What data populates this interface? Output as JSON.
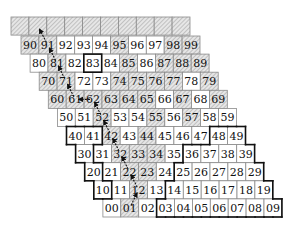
{
  "diagram": {
    "title": "",
    "geometry": {
      "top_row": {
        "x0": 11,
        "y0": 17
      },
      "row9_origin": {
        "x0": 21,
        "y0": 36
      },
      "cell_w": 17.9,
      "cell_h": 18.1,
      "row_shift_x": 9.1
    },
    "colors": {
      "hatch_bg": "#e6e6e6",
      "hatch_line": "#9a9a9a",
      "cell_border": "#8a8a8a",
      "bold_border": "#111111",
      "text": "#111111",
      "arrow": "#111111"
    },
    "top_row": {
      "count": 10,
      "hatched": true
    },
    "rows": [
      {
        "row": 9,
        "labels": [
          "90",
          "91",
          "92",
          "93",
          "94",
          "95",
          "96",
          "97",
          "98",
          "99"
        ],
        "hatched": [
          true,
          true,
          false,
          false,
          false,
          true,
          false,
          false,
          true,
          true
        ]
      },
      {
        "row": 8,
        "labels": [
          "80",
          "81",
          "82",
          "83",
          "84",
          "85",
          "86",
          "87",
          "88",
          "89"
        ],
        "hatched": [
          false,
          true,
          false,
          false,
          false,
          true,
          false,
          true,
          true,
          true
        ]
      },
      {
        "row": 7,
        "labels": [
          "70",
          "71",
          "72",
          "73",
          "74",
          "75",
          "76",
          "77",
          "78",
          "79"
        ],
        "hatched": [
          true,
          true,
          false,
          false,
          true,
          true,
          true,
          true,
          false,
          true
        ]
      },
      {
        "row": 6,
        "labels": [
          "60",
          "61",
          "62",
          "63",
          "64",
          "65",
          "66",
          "67",
          "68",
          "69"
        ],
        "hatched": [
          true,
          true,
          true,
          true,
          true,
          true,
          false,
          true,
          false,
          true
        ]
      },
      {
        "row": 5,
        "labels": [
          "50",
          "51",
          "52",
          "53",
          "54",
          "55",
          "56",
          "57",
          "58",
          "59"
        ],
        "hatched": [
          false,
          false,
          true,
          false,
          false,
          true,
          false,
          true,
          false,
          false
        ]
      },
      {
        "row": 4,
        "labels": [
          "40",
          "41",
          "42",
          "43",
          "44",
          "45",
          "46",
          "47",
          "48",
          "49"
        ],
        "hatched": [
          false,
          false,
          true,
          false,
          true,
          false,
          false,
          false,
          false,
          false
        ]
      },
      {
        "row": 3,
        "labels": [
          "30",
          "31",
          "32",
          "33",
          "34",
          "35",
          "36",
          "37",
          "38",
          "39"
        ],
        "hatched": [
          false,
          false,
          true,
          true,
          true,
          false,
          false,
          false,
          false,
          false
        ]
      },
      {
        "row": 2,
        "labels": [
          "20",
          "21",
          "22",
          "23",
          "24",
          "25",
          "26",
          "27",
          "28",
          "29"
        ],
        "hatched": [
          false,
          false,
          true,
          true,
          false,
          false,
          false,
          false,
          false,
          false
        ]
      },
      {
        "row": 1,
        "labels": [
          "10",
          "11",
          "12",
          "13",
          "14",
          "15",
          "16",
          "17",
          "18",
          "19"
        ],
        "hatched": [
          false,
          false,
          true,
          false,
          false,
          false,
          false,
          false,
          false,
          false
        ]
      },
      {
        "row": 0,
        "labels": [
          "00",
          "01",
          "02",
          "03",
          "04",
          "05",
          "06",
          "07",
          "08",
          "09"
        ],
        "hatched": [
          false,
          true,
          false,
          false,
          false,
          false,
          false,
          false,
          false,
          false
        ]
      }
    ],
    "bold_single_cells": [
      "83"
    ],
    "bold_region_left": [
      "40",
      "41",
      "30",
      "20",
      "10"
    ],
    "bold_region_right": [
      "48",
      "49",
      "36",
      "37",
      "38",
      "39",
      "25",
      "26",
      "27",
      "28",
      "29",
      "14",
      "15",
      "16",
      "17",
      "18",
      "19",
      "03",
      "04",
      "05",
      "06",
      "07",
      "08",
      "09"
    ],
    "arrow_path": [
      "01",
      "12",
      "22",
      "32",
      "42",
      "52",
      "62",
      "61",
      "71",
      "81",
      "91",
      "T1"
    ]
  }
}
